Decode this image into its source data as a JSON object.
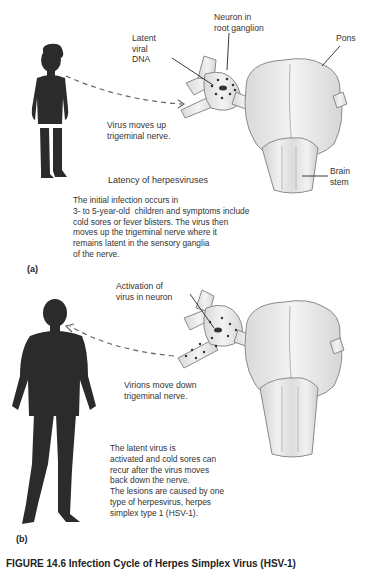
{
  "panel_a": {
    "panel_label": "(a)",
    "labels": {
      "latent_viral_dna": "Latent\nviral\nDNA",
      "neuron_in_root_ganglion": "Neuron in\nroot ganglion",
      "pons": "Pons",
      "brain_stem": "Brain\nstem"
    },
    "arrow_label": "Virus moves up\ntrigeminal nerve.",
    "title": "Latency of herpesviruses",
    "description": "The initial infection occurs in\n3- to 5-year-old  children and symptoms include\ncold sores or fever blisters. The virus then\nmoves up the trigeminal nerve where it\nremains latent in the sensory ganglia\nof the nerve."
  },
  "panel_b": {
    "panel_label": "(b)",
    "labels": {
      "activation_of_virus": "Activation of\nvirus in neuron"
    },
    "arrow_label": "Virions move down\ntrigeminal nerve.",
    "description": "The latent virus is\nactivated and cold sores can\nrecur after the virus moves\nback down the nerve.\nThe lesions are caused by one\ntype of herpesvirus, herpes\nsimplex type 1 (HSV-1)."
  },
  "caption": "FIGURE 14.6 Infection Cycle of Herpes Simplex Virus (HSV-1)",
  "colors": {
    "silhouette": "#2b2b2b",
    "tissue_fill": "#ededed",
    "tissue_stroke": "#8a8a8a",
    "text": "#333333"
  }
}
